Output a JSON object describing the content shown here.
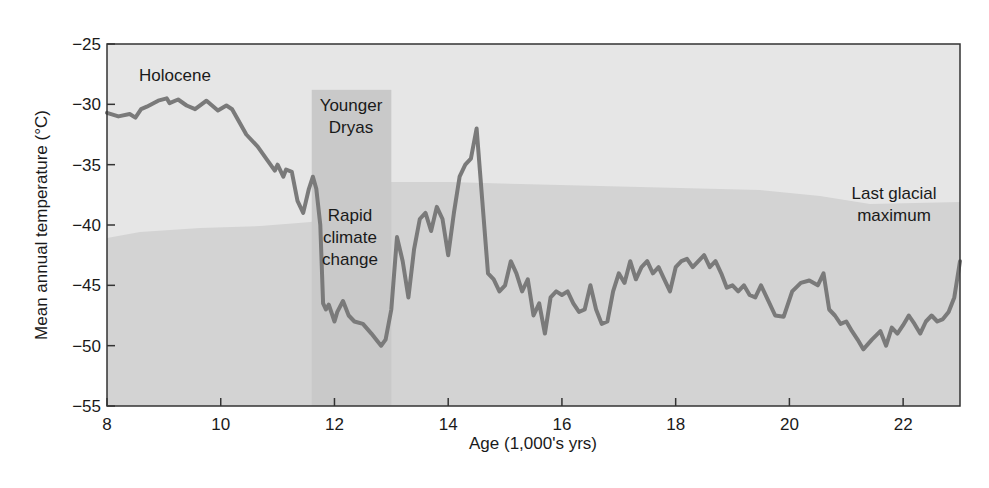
{
  "chart_data": {
    "type": "line",
    "title": "",
    "xlabel": "Age (1,000's yrs)",
    "ylabel": "Mean annual temperature (°C)",
    "xlim": [
      8,
      23
    ],
    "ylim": [
      -55,
      -25
    ],
    "xticks": [
      8,
      10,
      12,
      14,
      16,
      18,
      20,
      22
    ],
    "yticks": [
      -25,
      -30,
      -35,
      -40,
      -45,
      -50,
      -55
    ],
    "grid": false,
    "legend": null,
    "series": [
      {
        "name": "Mean annual temperature",
        "color": "#7a7a7a",
        "x": [
          8.0,
          8.2,
          8.4,
          8.5,
          8.6,
          8.7,
          8.9,
          9.05,
          9.1,
          9.25,
          9.4,
          9.55,
          9.75,
          9.95,
          10.1,
          10.2,
          10.45,
          10.65,
          10.8,
          10.95,
          11.0,
          11.1,
          11.15,
          11.25,
          11.35,
          11.45,
          11.55,
          11.62,
          11.68,
          11.75,
          11.8,
          11.85,
          11.9,
          12.0,
          12.05,
          12.15,
          12.25,
          12.35,
          12.5,
          12.65,
          12.75,
          12.82,
          12.9,
          13.0,
          13.1,
          13.2,
          13.3,
          13.4,
          13.5,
          13.6,
          13.7,
          13.8,
          13.9,
          14.0,
          14.1,
          14.2,
          14.3,
          14.4,
          14.5,
          14.6,
          14.7,
          14.8,
          14.9,
          15.0,
          15.1,
          15.2,
          15.3,
          15.4,
          15.5,
          15.6,
          15.7,
          15.8,
          15.9,
          16.0,
          16.1,
          16.2,
          16.3,
          16.4,
          16.5,
          16.6,
          16.7,
          16.8,
          16.9,
          17.0,
          17.1,
          17.2,
          17.3,
          17.4,
          17.5,
          17.6,
          17.7,
          17.8,
          17.9,
          18.0,
          18.1,
          18.2,
          18.3,
          18.4,
          18.5,
          18.6,
          18.7,
          18.8,
          18.9,
          19.0,
          19.1,
          19.2,
          19.3,
          19.4,
          19.5,
          19.6,
          19.75,
          19.9,
          20.05,
          20.2,
          20.35,
          20.5,
          20.6,
          20.7,
          20.8,
          20.9,
          21.0,
          21.1,
          21.2,
          21.3,
          21.45,
          21.6,
          21.7,
          21.8,
          21.9,
          22.0,
          22.1,
          22.2,
          22.3,
          22.4,
          22.5,
          22.6,
          22.7,
          22.8,
          22.9,
          23.0
        ],
        "y": [
          -30.7,
          -31.0,
          -30.8,
          -31.1,
          -30.4,
          -30.2,
          -29.7,
          -29.5,
          -29.9,
          -29.6,
          -30.1,
          -30.4,
          -29.7,
          -30.5,
          -30.1,
          -30.4,
          -32.5,
          -33.5,
          -34.5,
          -35.5,
          -35.0,
          -36.0,
          -35.4,
          -35.6,
          -38.0,
          -39.0,
          -37.0,
          -36.0,
          -37.0,
          -40.0,
          -46.5,
          -47.0,
          -46.6,
          -48.0,
          -47.2,
          -46.3,
          -47.5,
          -48.0,
          -48.2,
          -49.0,
          -49.6,
          -50.0,
          -49.5,
          -47.0,
          -41.0,
          -43.0,
          -46.0,
          -42.0,
          -39.5,
          -39.0,
          -40.5,
          -38.5,
          -39.5,
          -42.5,
          -39.0,
          -36.0,
          -35.0,
          -34.5,
          -32.0,
          -38.0,
          -44.0,
          -44.5,
          -45.5,
          -45.0,
          -43.0,
          -44.0,
          -45.5,
          -44.5,
          -47.5,
          -46.5,
          -49.0,
          -46.0,
          -45.5,
          -45.8,
          -45.5,
          -46.5,
          -47.2,
          -47.0,
          -45.0,
          -47.0,
          -48.2,
          -48.0,
          -45.5,
          -44.0,
          -44.8,
          -43.0,
          -44.5,
          -43.5,
          -43.0,
          -44.0,
          -43.5,
          -44.5,
          -45.5,
          -43.5,
          -43.0,
          -42.8,
          -43.5,
          -43.0,
          -42.5,
          -43.5,
          -43.0,
          -44.0,
          -45.2,
          -45.0,
          -45.5,
          -45.0,
          -45.8,
          -46.0,
          -45.0,
          -46.0,
          -47.5,
          -47.6,
          -45.5,
          -44.8,
          -44.6,
          -45.0,
          -44.0,
          -47.0,
          -47.5,
          -48.2,
          -48.0,
          -48.8,
          -49.5,
          -50.3,
          -49.5,
          -48.8,
          -50.0,
          -48.5,
          -49.0,
          -48.3,
          -47.5,
          -48.2,
          -49.0,
          -48.0,
          -47.5,
          -48.0,
          -47.8,
          -47.2,
          -46.0,
          -43.0
        ]
      }
    ],
    "shaded_regions": [
      {
        "label": "Younger Dryas",
        "x_start": 11.6,
        "x_end": 13.0,
        "y_top": -28.8
      }
    ],
    "annotations": [
      {
        "text": "Holocene",
        "x": 9.0,
        "y": -28.0
      },
      {
        "text": "Younger Dryas",
        "x": 12.3,
        "y": -30.5
      },
      {
        "text": "Rapid climate change",
        "x": 12.3,
        "y": -41.0
      },
      {
        "text": "Last glacial maximum",
        "x": 22.0,
        "y": -38.5
      }
    ]
  },
  "labels": {
    "xlabel": "Age (1,000's yrs)",
    "ylabel": "Mean annual temperature (°C)",
    "holocene": "Holocene",
    "younger_dryas_1": "Younger",
    "younger_dryas_2": "Dryas",
    "rapid_1": "Rapid",
    "rapid_2": "climate",
    "rapid_3": "change",
    "lgm_1": "Last glacial",
    "lgm_2": "maximum"
  },
  "colors": {
    "plot_bg": "#e6e6e6",
    "ice_region": "#d3d3d3",
    "band": "#c9c9c9",
    "line": "#7a7a7a",
    "axis": "#333333"
  }
}
